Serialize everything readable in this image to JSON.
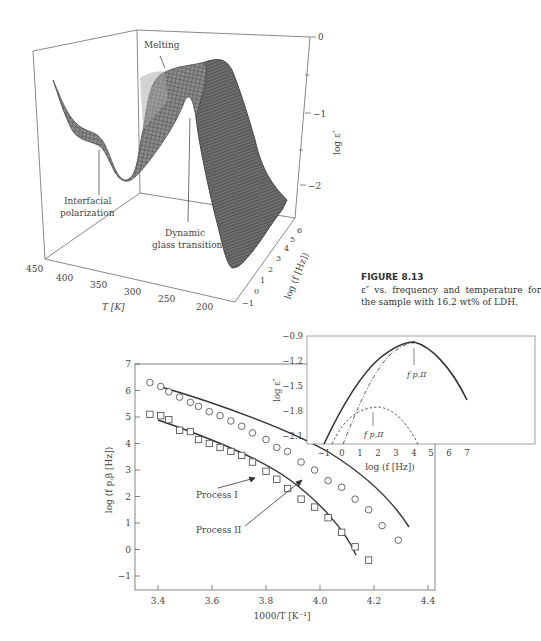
{
  "figure_top": {
    "caption_label": "FIGURE 8.13",
    "caption_text": "ε″ vs. frequency and temperature for the sample with 16.2 wt% of LDH.",
    "annotations": [
      "Melting",
      "Interfacial",
      "polarization",
      "Dynamic",
      "glass transition"
    ],
    "z_axis_label": "log ε″",
    "z_ticks": [
      "0",
      "−1",
      "−2"
    ],
    "t_axis_label": "T [K]",
    "t_ticks": [
      "450",
      "400",
      "350",
      "300",
      "250",
      "200"
    ],
    "f_axis_label": "log (f [Hz])",
    "f_ticks": [
      "−1",
      "0",
      "1",
      "2",
      "3",
      "4",
      "5",
      "6"
    ]
  },
  "figure_bottom": {
    "ylabel": "log (f p,β [Hz])",
    "xlabel": "1000/T [K⁻¹]",
    "xticks": [
      "3.4",
      "3.6",
      "3.8",
      "4.0",
      "4.2",
      "4.4"
    ],
    "yticks": [
      "7",
      "6",
      "5",
      "4",
      "3",
      "2",
      "1",
      "0",
      "−1"
    ],
    "process1_label": "Process I",
    "process2_label": "Process II",
    "inset": {
      "ylabel": "log ε″",
      "xlabel": "log (f [Hz])",
      "yticks": [
        "−0.9",
        "−1.2",
        "−1.5",
        "−1.8",
        "−2.1"
      ],
      "xticks": [
        "−1",
        "0",
        "1",
        "2",
        "3",
        "4",
        "5",
        "6",
        "7"
      ],
      "peak_label_1": "f p,II",
      "peak_label_2": "f p,II"
    }
  },
  "chart_data": [
    {
      "type": "surface3d",
      "title": "ε″ vs. frequency and temperature (16.2 wt% LDH)",
      "xlabel": "T [K]",
      "xlim": [
        450,
        180
      ],
      "ylabel": "log (f [Hz])",
      "ylim": [
        -1,
        6
      ],
      "zlabel": "log ε″",
      "zlim": [
        -2.5,
        0
      ],
      "annotations": [
        "Melting",
        "Interfacial polarization",
        "Dynamic glass transition"
      ]
    },
    {
      "type": "scatter",
      "xlabel": "1000/T [K⁻¹]",
      "ylabel": "log (f p,β [Hz])",
      "xlim": [
        3.3,
        4.4
      ],
      "ylim": [
        -1.5,
        7
      ],
      "series": [
        {
          "name": "Process I",
          "marker": "circle",
          "x": [
            3.37,
            3.41,
            3.44,
            3.48,
            3.52,
            3.55,
            3.59,
            3.63,
            3.67,
            3.71,
            3.75,
            3.8,
            3.84,
            3.88,
            3.93,
            3.98,
            4.03,
            4.08,
            4.13,
            4.18,
            4.23,
            4.29
          ],
          "y": [
            6.3,
            6.15,
            5.95,
            5.75,
            5.55,
            5.4,
            5.2,
            5.05,
            4.85,
            4.65,
            4.4,
            4.15,
            3.85,
            3.7,
            3.3,
            3.0,
            2.6,
            2.35,
            1.9,
            1.5,
            0.9,
            0.35
          ]
        },
        {
          "name": "Process II",
          "marker": "square",
          "x": [
            3.37,
            3.41,
            3.44,
            3.48,
            3.52,
            3.55,
            3.59,
            3.63,
            3.67,
            3.71,
            3.75,
            3.8,
            3.84,
            3.88,
            3.93,
            3.98,
            4.03,
            4.08,
            4.13,
            4.18
          ],
          "y": [
            5.1,
            5.05,
            4.9,
            4.5,
            4.45,
            4.15,
            4.0,
            3.85,
            3.7,
            3.55,
            3.3,
            2.95,
            2.65,
            2.3,
            1.9,
            1.6,
            1.2,
            0.65,
            0.1,
            -0.4
          ]
        }
      ]
    },
    {
      "type": "line",
      "xlabel": "log (f [Hz])",
      "ylabel": "log ε″",
      "xlim": [
        -1.5,
        7
      ],
      "ylim": [
        -2.25,
        -0.9
      ],
      "series": [
        {
          "name": "data (symbols)",
          "x": [
            -1,
            0,
            1,
            2,
            3,
            4,
            5,
            6,
            7
          ],
          "y": [
            -2.2,
            -1.85,
            -1.5,
            -1.25,
            -1.05,
            -0.95,
            -1.05,
            -1.3,
            -1.65
          ]
        },
        {
          "name": "fit total",
          "x": [
            -1,
            0,
            1,
            2,
            3,
            4,
            5,
            6,
            7
          ],
          "y": [
            -2.2,
            -1.85,
            -1.5,
            -1.25,
            -1.05,
            -0.95,
            -1.05,
            -1.3,
            -1.65
          ]
        },
        {
          "name": "process II component",
          "x": [
            0.3,
            1,
            2,
            3,
            4,
            5,
            6,
            7
          ],
          "y": [
            -2.2,
            -1.8,
            -1.35,
            -1.1,
            -0.96,
            -1.05,
            -1.3,
            -1.65
          ]
        },
        {
          "name": "low-frequency component",
          "x": [
            -0.3,
            0.5,
            1,
            2,
            3,
            4.1
          ],
          "y": [
            -2.2,
            -1.9,
            -1.78,
            -1.75,
            -1.85,
            -2.2
          ]
        }
      ],
      "annotations": [
        "f p,II (at log f ≈ 4)",
        "f p,II (at log f ≈ 1.8)"
      ]
    }
  ]
}
